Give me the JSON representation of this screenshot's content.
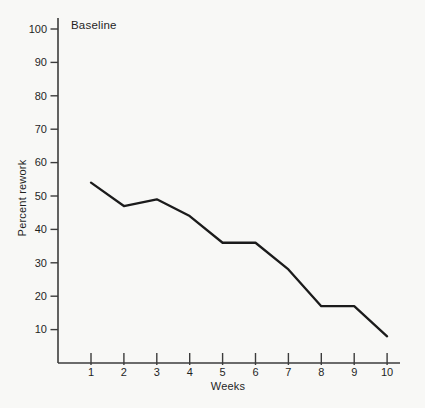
{
  "chart_data": {
    "type": "line",
    "title": "",
    "annotation": "Baseline",
    "annotation_position": "top-left",
    "xlabel": "Weeks",
    "ylabel": "Percent rework",
    "x": [
      1,
      2,
      3,
      4,
      5,
      6,
      7,
      8,
      9,
      10
    ],
    "series": [
      {
        "name": "Percent rework",
        "values": [
          54,
          47,
          49,
          44,
          36,
          36,
          28,
          17,
          17,
          8
        ]
      }
    ],
    "xticks": [
      1,
      2,
      3,
      4,
      5,
      6,
      7,
      8,
      9,
      10
    ],
    "yticks": [
      10,
      20,
      30,
      40,
      50,
      60,
      70,
      80,
      90,
      100
    ],
    "ylim": [
      0,
      100
    ],
    "xlim": [
      0,
      10.4
    ],
    "grid": false,
    "legend": false,
    "colors": {
      "line": "#1b1b1b",
      "axis": "#3c3c3c",
      "text": "#1f1f1f",
      "background": "#f8f8f6"
    }
  }
}
